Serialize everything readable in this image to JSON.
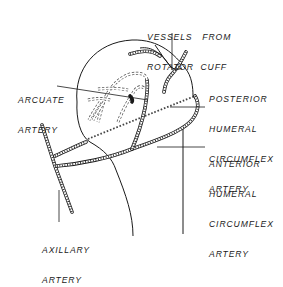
{
  "figure": {
    "style": "black line drawing on white",
    "colors": {
      "ink": "#1a1a1a",
      "background": "#ffffff"
    }
  },
  "labels": {
    "vessels_rotator_cuff": {
      "line1": "VESSELS   FROM",
      "line2": "ROTATOR  CUFF"
    },
    "arcuate_artery": {
      "line1": "ARCUATE",
      "line2": "ARTERY"
    },
    "posterior_humeral_circumflex": {
      "line1": "POSTERIOR",
      "line2": "HUMERAL",
      "line3": "CIRCUMFLEX",
      "line4": "ARTERY"
    },
    "anterior_humeral_circumflex": {
      "line1": "ANTERIOR",
      "line2": "HUMERAL",
      "line3": "CIRCUMFLEX",
      "line4": "ARTERY"
    },
    "axillary_artery": {
      "line1": "AXILLARY",
      "line2": "ARTERY"
    }
  }
}
